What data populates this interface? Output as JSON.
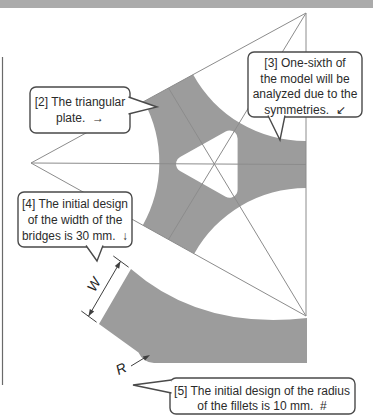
{
  "colors": {
    "background": "#ffffff",
    "top_bar": "#ababab",
    "plate": "#9c9c9c",
    "hole": "#ffffff",
    "construction_line": "#8c8c8c",
    "dimension_line": "#3f3f3f",
    "callout_border": "#4a4a4a",
    "text": "#2b2b2b"
  },
  "callouts": {
    "c2": {
      "lines": [
        "[2] The triangular",
        "plate.  →"
      ]
    },
    "c3": {
      "lines": [
        "[3] One-sixth of",
        "the model will be",
        "analyzed due to the",
        "symmetries.  ↙"
      ]
    },
    "c4": {
      "lines": [
        "[4] The initial design",
        "of the width of the",
        "bridges is 30 mm.  ↓"
      ]
    },
    "c5": {
      "lines": [
        "[5] The initial design of the radius",
        "of the fillets is 10 mm.  #"
      ]
    }
  },
  "dimensions": {
    "width_label": "W",
    "radius_label": "R"
  }
}
